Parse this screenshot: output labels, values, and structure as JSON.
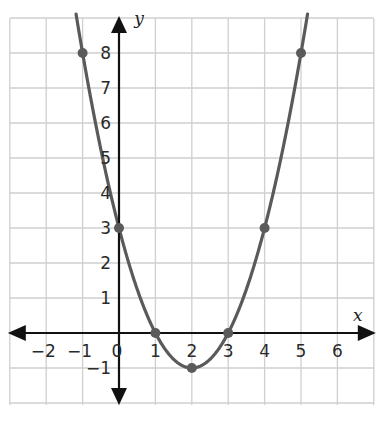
{
  "chart_data": {
    "type": "line",
    "title": "",
    "xlabel": "x",
    "ylabel": "y",
    "xlim": [
      -3,
      7
    ],
    "ylim": [
      -2,
      9
    ],
    "grid": true,
    "legend": null,
    "x_ticks": [
      "-2",
      "-1",
      "0",
      "1",
      "2",
      "3",
      "4",
      "5",
      "6"
    ],
    "y_ticks": [
      "-1",
      "1",
      "2",
      "3",
      "4",
      "5",
      "6",
      "7",
      "8"
    ],
    "function": "y = (x - 2)^2 - 1",
    "series": [
      {
        "name": "parabola",
        "x": [
          -1,
          0,
          1,
          2,
          3,
          4,
          5
        ],
        "y": [
          8,
          3,
          0,
          -1,
          0,
          3,
          8
        ]
      }
    ],
    "points": [
      {
        "x": -1,
        "y": 8
      },
      {
        "x": 0,
        "y": 3
      },
      {
        "x": 1,
        "y": 0
      },
      {
        "x": 2,
        "y": -1
      },
      {
        "x": 3,
        "y": 0
      },
      {
        "x": 4,
        "y": 3
      },
      {
        "x": 5,
        "y": 8
      }
    ],
    "colors": {
      "curve": "#5a5a5a",
      "axes": "#111111",
      "grid": "#cfcfcf"
    }
  }
}
